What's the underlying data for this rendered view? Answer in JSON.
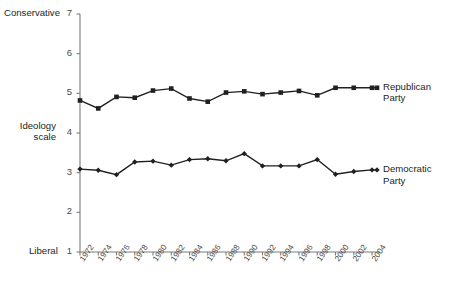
{
  "chart_data": {
    "type": "line",
    "title": "",
    "xlabel": "",
    "ylabel": "Ideology scale",
    "ylabel_lines": [
      "Ideology",
      "scale"
    ],
    "ylim": [
      1,
      7
    ],
    "ytick_values": [
      1,
      2,
      3,
      4,
      5,
      6,
      7
    ],
    "ytick_labels": [
      "1",
      "2",
      "3",
      "4",
      "5",
      "6",
      "7"
    ],
    "y_axis_anchors": {
      "high": "Conservative",
      "low": "Liberal"
    },
    "grid": false,
    "legend_position": "right-inline",
    "categories": [
      "1972",
      "1974",
      "1976",
      "1978",
      "1980",
      "1982",
      "1984",
      "1986",
      "1988",
      "1990",
      "1992",
      "1994",
      "1996",
      "1998",
      "2000",
      "2002",
      "2004"
    ],
    "x": [
      1972,
      1974,
      1976,
      1978,
      1980,
      1982,
      1984,
      1986,
      1988,
      1990,
      1992,
      1994,
      1996,
      1998,
      2000,
      2002,
      2004
    ],
    "series": [
      {
        "name": "Republican Party",
        "label_lines": [
          "Republican",
          "Party"
        ],
        "color": "#231f20",
        "marker": "square",
        "values": [
          4.82,
          4.62,
          4.91,
          4.89,
          5.07,
          5.12,
          4.87,
          4.79,
          5.02,
          5.05,
          4.98,
          5.02,
          5.06,
          4.95,
          5.14,
          5.14,
          5.14
        ]
      },
      {
        "name": "Democratic Party",
        "label_lines": [
          "Democratic",
          "Party"
        ],
        "color": "#231f20",
        "marker": "diamond",
        "values": [
          3.09,
          3.06,
          2.95,
          3.27,
          3.29,
          3.19,
          3.33,
          3.35,
          3.3,
          3.48,
          3.17,
          3.17,
          3.17,
          3.33,
          2.96,
          3.03,
          3.07
        ]
      }
    ]
  },
  "geometry": {
    "plot_left": 80,
    "plot_right": 372,
    "plot_top": 14,
    "plot_bottom": 252,
    "legend_x": 380
  }
}
